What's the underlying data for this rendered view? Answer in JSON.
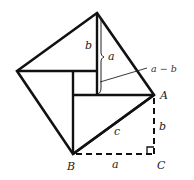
{
  "diagram": {
    "colors": {
      "stroke": "#111111",
      "background": "#ffffff",
      "label": "#222222"
    },
    "vertices": {
      "top": [
        97,
        13
      ],
      "left": [
        17,
        71
      ],
      "A": [
        154,
        95
      ],
      "B": [
        73,
        154
      ],
      "C": [
        154,
        154
      ]
    },
    "inner_square": {
      "x1": 73,
      "y1": 71,
      "x2": 97,
      "y2": 95
    },
    "labels": {
      "A": "A",
      "B": "B",
      "C": "C",
      "top_b": "b",
      "top_a": "a",
      "diff": "a − b",
      "hyp_c": "c",
      "right_b": "b",
      "bottom_a": "a"
    }
  }
}
